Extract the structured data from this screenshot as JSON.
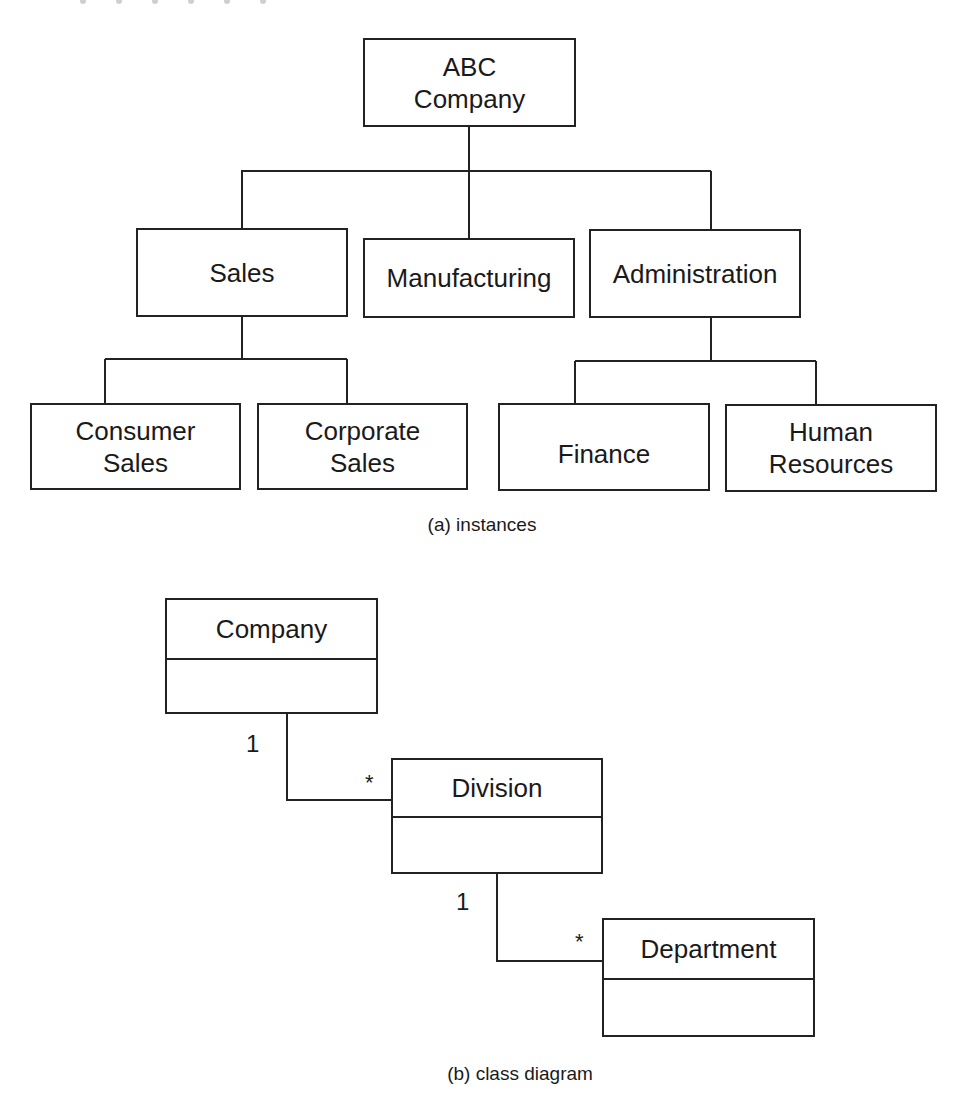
{
  "instances_diagram": {
    "root": {
      "label": "ABC\nCompany"
    },
    "divisions": [
      {
        "label": "Sales"
      },
      {
        "label": "Manufacturing"
      },
      {
        "label": "Administration"
      }
    ],
    "departments": [
      {
        "label": "Consumer\nSales",
        "parent": "Sales"
      },
      {
        "label": "Corporate\nSales",
        "parent": "Sales"
      },
      {
        "label": "Finance",
        "parent": "Administration"
      },
      {
        "label": "Human\nResources",
        "parent": "Administration"
      }
    ],
    "caption": "(a) instances"
  },
  "class_diagram": {
    "classes": [
      {
        "name": "Company"
      },
      {
        "name": "Division"
      },
      {
        "name": "Department"
      }
    ],
    "associations": [
      {
        "from": "Company",
        "to": "Division",
        "from_multiplicity": "1",
        "to_multiplicity": "*"
      },
      {
        "from": "Division",
        "to": "Department",
        "from_multiplicity": "1",
        "to_multiplicity": "*"
      }
    ],
    "caption": "(b) class diagram"
  },
  "colors": {
    "line": "#222222",
    "text": "#1a1a1a",
    "background": "#ffffff"
  }
}
